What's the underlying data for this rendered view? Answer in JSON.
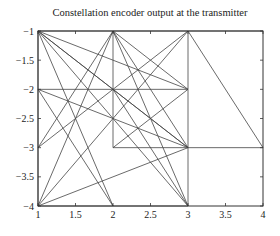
{
  "chart_data": {
    "type": "line",
    "title": "Constellation encoder output at the transmitter",
    "xlabel": "",
    "ylabel": "",
    "xlim": [
      1,
      4
    ],
    "ylim": [
      -4,
      -1
    ],
    "xticks": [
      "1",
      "1.5",
      "2",
      "2.5",
      "3",
      "3.5",
      "4"
    ],
    "yticks": [
      "-1",
      "-1.5",
      "-2",
      "-2.5",
      "-3",
      "-3.5",
      "-4"
    ],
    "grid": false,
    "line_color": "#444444",
    "segments": [
      [
        [
          1,
          -1
        ],
        [
          2,
          -1
        ]
      ],
      [
        [
          2,
          -1
        ],
        [
          3,
          -1
        ]
      ],
      [
        [
          3,
          -1
        ],
        [
          4,
          -1
        ]
      ],
      [
        [
          1,
          -1
        ],
        [
          1,
          -2
        ]
      ],
      [
        [
          1,
          -2
        ],
        [
          1,
          -3
        ]
      ],
      [
        [
          1,
          -3
        ],
        [
          1,
          -4
        ]
      ],
      [
        [
          1,
          -1
        ],
        [
          3,
          -2
        ]
      ],
      [
        [
          1,
          -1
        ],
        [
          2,
          -2
        ]
      ],
      [
        [
          1,
          -1
        ],
        [
          3,
          -3
        ]
      ],
      [
        [
          1,
          -1
        ],
        [
          2,
          -4
        ]
      ],
      [
        [
          1,
          -1
        ],
        [
          3,
          -4
        ]
      ],
      [
        [
          2,
          -1
        ],
        [
          2,
          -2
        ]
      ],
      [
        [
          2,
          -1
        ],
        [
          3,
          -2
        ]
      ],
      [
        [
          2,
          -1
        ],
        [
          1,
          -3
        ]
      ],
      [
        [
          2,
          -1
        ],
        [
          3,
          -3
        ]
      ],
      [
        [
          2,
          -1
        ],
        [
          3,
          -4
        ]
      ],
      [
        [
          2,
          -1
        ],
        [
          1,
          -4
        ]
      ],
      [
        [
          3,
          -1
        ],
        [
          3,
          -2
        ]
      ],
      [
        [
          3,
          -1
        ],
        [
          2,
          -2
        ]
      ],
      [
        [
          3,
          -1
        ],
        [
          1,
          -4
        ]
      ],
      [
        [
          3,
          -1
        ],
        [
          4,
          -3
        ]
      ],
      [
        [
          1,
          -2
        ],
        [
          2,
          -2
        ]
      ],
      [
        [
          2,
          -2
        ],
        [
          3,
          -2
        ]
      ],
      [
        [
          1,
          -2
        ],
        [
          3,
          -3
        ]
      ],
      [
        [
          1,
          -2
        ],
        [
          2,
          -4
        ]
      ],
      [
        [
          2,
          -2
        ],
        [
          3,
          -3
        ]
      ],
      [
        [
          2,
          -2
        ],
        [
          3,
          -4
        ]
      ],
      [
        [
          2,
          -2
        ],
        [
          1,
          -3
        ]
      ],
      [
        [
          2,
          -2
        ],
        [
          2,
          -3
        ]
      ],
      [
        [
          3,
          -2
        ],
        [
          3,
          -3
        ]
      ],
      [
        [
          3,
          -2
        ],
        [
          2,
          -3
        ]
      ],
      [
        [
          2,
          -3
        ],
        [
          3,
          -3
        ]
      ],
      [
        [
          3,
          -3
        ],
        [
          4,
          -3
        ]
      ],
      [
        [
          3,
          -3
        ],
        [
          1,
          -4
        ]
      ],
      [
        [
          3,
          -3
        ],
        [
          3,
          -4
        ]
      ],
      [
        [
          1,
          -4
        ],
        [
          2,
          -4
        ]
      ],
      [
        [
          2,
          -4
        ],
        [
          3,
          -4
        ]
      ]
    ]
  }
}
